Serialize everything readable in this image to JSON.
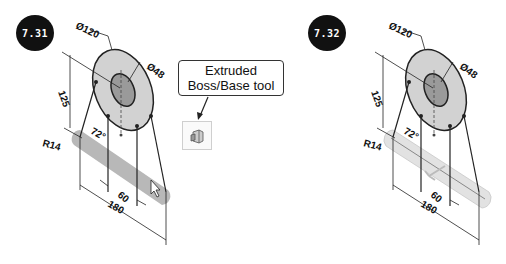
{
  "figures": [
    {
      "id": "left",
      "badge": "7.31",
      "dimensions": {
        "outer_diameter": "Ø120",
        "inner_diameter": "Ø48",
        "height": "125",
        "angle": "72°",
        "radius": "R14",
        "spacing": "60",
        "length": "180"
      },
      "bar_state": "sketch"
    },
    {
      "id": "right",
      "badge": "7.32",
      "dimensions": {
        "outer_diameter": "Ø120",
        "inner_diameter": "Ø48",
        "height": "125",
        "angle": "72°",
        "radius": "R14",
        "spacing": "60",
        "length": "180"
      },
      "bar_state": "extruded-preview"
    }
  ],
  "callout": {
    "line1": "Extruded",
    "line2": "Boss/Base tool",
    "icon": "extruded-boss-base-icon"
  },
  "colors": {
    "outer_fill": "#d2d2d2",
    "inner_fill": "#9a9a9a",
    "sketch_bar": "#b8b8b8",
    "extruded_bar": "#e2e2e2",
    "badge_bg": "#111111"
  }
}
